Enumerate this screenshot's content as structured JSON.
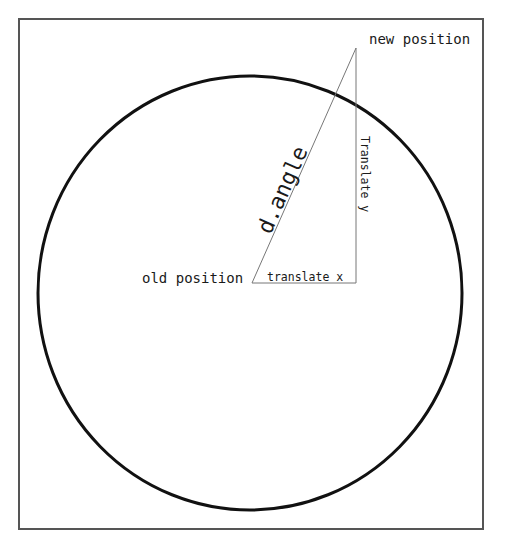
{
  "diagram": {
    "labels": {
      "new_position": "new position",
      "old_position": "old position",
      "translate_x": "translate x",
      "translate_y": "Translate y",
      "angle": "d.angle"
    },
    "frame": {
      "x": 19,
      "y": 19,
      "width": 464,
      "height": 510,
      "stroke": "#555555"
    },
    "circle": {
      "cx": 250,
      "cy": 293,
      "r": 215,
      "stroke": "#111111",
      "stroke_width": 3
    },
    "triangle": {
      "old_position": {
        "x": 252,
        "y": 283
      },
      "new_position": {
        "x": 356,
        "y": 48
      },
      "right_angle_corner": {
        "x": 356,
        "y": 283
      },
      "stroke": "#777777"
    }
  }
}
